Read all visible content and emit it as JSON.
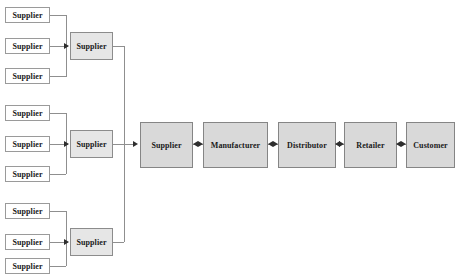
{
  "diagram": {
    "canvas": {
      "width": 464,
      "height": 279
    },
    "colors": {
      "leaf_fill": "#ffffff",
      "leaf_border": "#9a9a9a",
      "aggregator_fill": "#e6e6e6",
      "aggregator_border": "#8c8c8c",
      "chain_fill": "#d9d9d9",
      "chain_border": "#858585",
      "wire": "#8f8f8f",
      "arrow": "#2e2e2e",
      "background": "#ffffff",
      "text": "#1a1a1a"
    }
  },
  "supplier_groups": [
    {
      "group_id": "group-1",
      "leaves": [
        {
          "label": "Supplier",
          "x": 5,
          "y": 7,
          "w": 45,
          "h": 16
        },
        {
          "label": "Supplier",
          "x": 5,
          "y": 38,
          "w": 45,
          "h": 16
        },
        {
          "label": "Supplier",
          "x": 5,
          "y": 68,
          "w": 45,
          "h": 16
        }
      ],
      "aggregator": {
        "label": "Supplier",
        "x": 70,
        "y": 32,
        "w": 43,
        "h": 28
      }
    },
    {
      "group_id": "group-2",
      "leaves": [
        {
          "label": "Supplier",
          "x": 5,
          "y": 105,
          "w": 45,
          "h": 16
        },
        {
          "label": "Supplier",
          "x": 5,
          "y": 136,
          "w": 45,
          "h": 16
        },
        {
          "label": "Supplier",
          "x": 5,
          "y": 166,
          "w": 45,
          "h": 16
        }
      ],
      "aggregator": {
        "label": "Supplier",
        "x": 70,
        "y": 130,
        "w": 43,
        "h": 28
      }
    },
    {
      "group_id": "group-3",
      "leaves": [
        {
          "label": "Supplier",
          "x": 5,
          "y": 203,
          "w": 45,
          "h": 16
        },
        {
          "label": "Supplier",
          "x": 5,
          "y": 234,
          "w": 45,
          "h": 16
        },
        {
          "label": "Supplier",
          "x": 5,
          "y": 258,
          "w": 45,
          "h": 16
        }
      ],
      "aggregator": {
        "label": "Supplier",
        "x": 70,
        "y": 228,
        "w": 43,
        "h": 28
      }
    }
  ],
  "main_chain": {
    "nodes": [
      {
        "id": "chain-supplier",
        "label": "Supplier",
        "x": 140,
        "y": 122,
        "w": 53,
        "h": 46
      },
      {
        "id": "chain-manufacturer",
        "label": "Manufacturer",
        "x": 203,
        "y": 122,
        "w": 65,
        "h": 46
      },
      {
        "id": "chain-distributor",
        "label": "Distributor",
        "x": 278,
        "y": 122,
        "w": 58,
        "h": 46
      },
      {
        "id": "chain-retailer",
        "label": "Retailer",
        "x": 344,
        "y": 122,
        "w": 53,
        "h": 46
      },
      {
        "id": "chain-customer",
        "label": "Customer",
        "x": 406,
        "y": 122,
        "w": 49,
        "h": 46
      }
    ],
    "connector_type": "bidirectional-arrow",
    "connector_count": 4
  }
}
